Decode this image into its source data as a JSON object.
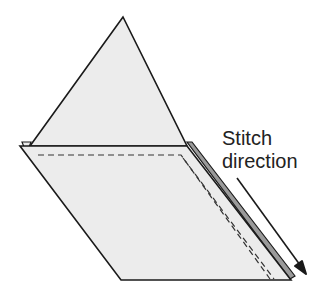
{
  "diagram": {
    "labels": {
      "line1": "Stitch",
      "line2": "direction"
    },
    "colors": {
      "fabric_fill": "#ececec",
      "outline": "#1a1a1a",
      "seam_strip": "#9a9a9a",
      "stitch": "#333333"
    }
  }
}
